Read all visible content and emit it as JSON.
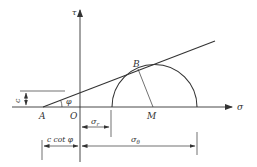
{
  "diagram": {
    "type": "mohr-circle",
    "axes": {
      "x_label": "σ",
      "y_label": "τ"
    },
    "points": {
      "A": "A",
      "O": "O",
      "B": "B",
      "M": "M"
    },
    "angle_label": "φ",
    "dimensions": {
      "c": "c",
      "sigma_r": "σ",
      "sigma_r_sub": "r",
      "c_cot_phi": "c cot φ",
      "sigma_theta": "σ",
      "sigma_theta_sub": "θ"
    },
    "colors": {
      "line": "#333333",
      "background": "#ffffff"
    }
  }
}
